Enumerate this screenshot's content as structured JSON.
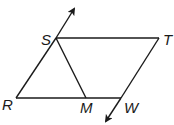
{
  "diagram": {
    "type": "geometry",
    "stroke_color": "#1a1a1a",
    "points": {
      "S": {
        "label": "S",
        "x": 56,
        "y": 38,
        "label_x": 41,
        "label_y": 45
      },
      "T": {
        "label": "T",
        "x": 159,
        "y": 38,
        "label_x": 163,
        "label_y": 45
      },
      "R": {
        "label": "R",
        "x": 16,
        "y": 98,
        "label_x": 2,
        "label_y": 110
      },
      "M": {
        "label": "M",
        "x": 86,
        "y": 98,
        "label_x": 80,
        "label_y": 113
      },
      "W": {
        "label": "W",
        "x": 121,
        "y": 98,
        "label_x": 124,
        "label_y": 113
      }
    },
    "segments": [
      {
        "from": "R",
        "to": "S"
      },
      {
        "from": "S",
        "to": "T"
      },
      {
        "from": "T",
        "to": "W"
      },
      {
        "from": "R",
        "to": "W"
      },
      {
        "from": "S",
        "to": "M"
      }
    ],
    "rays": [
      {
        "name": "ray-RS",
        "from": "S",
        "to_x": 74,
        "to_y": 9
      },
      {
        "name": "ray-TW",
        "from": "W",
        "to_x": 106,
        "to_y": 121
      }
    ]
  }
}
